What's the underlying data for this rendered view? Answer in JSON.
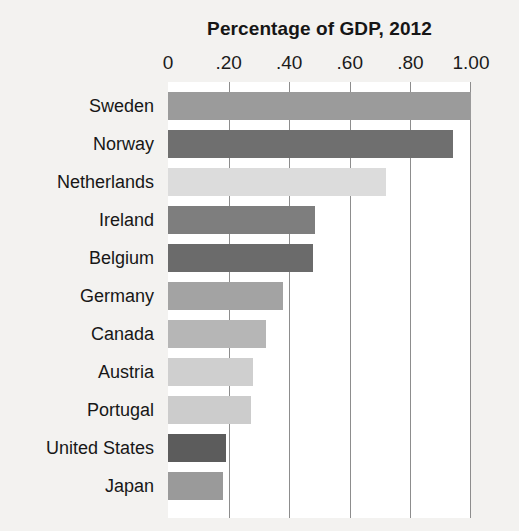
{
  "chart_data": {
    "type": "bar",
    "orientation": "horizontal",
    "title": "Percentage of GDP, 2012",
    "xlabel": "",
    "ylabel": "",
    "xlim": [
      0,
      1.0
    ],
    "xticks": [
      0,
      0.2,
      0.4,
      0.6,
      0.8,
      1.0
    ],
    "xtick_labels": [
      "0",
      ".20",
      ".40",
      ".60",
      ".80",
      "1.00"
    ],
    "grid": true,
    "legend": "none",
    "categories": [
      "Sweden",
      "Norway",
      "Netherlands",
      "Ireland",
      "Belgium",
      "Germany",
      "Canada",
      "Austria",
      "Portugal",
      "United States",
      "Japan"
    ],
    "values": [
      1.0,
      0.94,
      0.72,
      0.485,
      0.478,
      0.38,
      0.325,
      0.28,
      0.275,
      0.19,
      0.18
    ],
    "bar_colors": [
      "#9b9b9b",
      "#6f6f6f",
      "#dcdcdc",
      "#7e7e7e",
      "#6b6b6b",
      "#a3a3a3",
      "#b6b6b6",
      "#cfcfcf",
      "#cccccc",
      "#5c5c5c",
      "#9a9a9a"
    ],
    "background_color": "#f3f2f0",
    "plot_background_color": "#ffffff",
    "gridline_color": "#8d8d8d",
    "title_color": "#161616"
  }
}
